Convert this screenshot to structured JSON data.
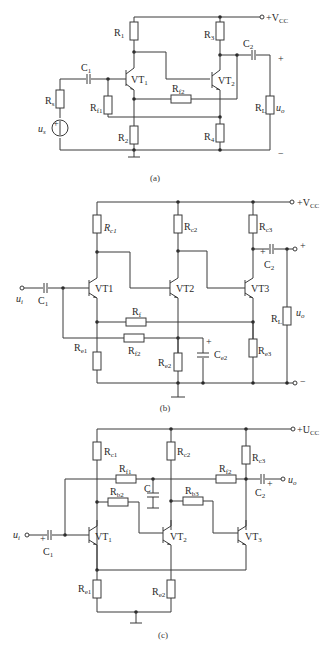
{
  "header_fragment": "",
  "figures": [
    {
      "caption": "(a)",
      "supply": "+V",
      "supply_sub": "CC",
      "labels": {
        "R1": [
          "R",
          "1"
        ],
        "R2": [
          "R",
          "2"
        ],
        "R3": [
          "R",
          "3"
        ],
        "R4": [
          "R",
          "4"
        ],
        "Rs": [
          "R",
          "s"
        ],
        "Rf1": [
          "R",
          "f1"
        ],
        "Rf2": [
          "R",
          "f2"
        ],
        "RL": [
          "R",
          "L"
        ],
        "C1": [
          "C",
          "1"
        ],
        "C2": [
          "C",
          "2"
        ],
        "VT1": [
          "VT",
          "1"
        ],
        "VT2": [
          "VT",
          "2"
        ],
        "us": [
          "u",
          "s"
        ],
        "uo": [
          "u",
          "o"
        ]
      },
      "plus": "+",
      "minus": "−"
    },
    {
      "caption": "(b)",
      "supply": "+V",
      "supply_sub": "CC",
      "labels": {
        "Rc1": [
          "R",
          "c1"
        ],
        "Rc2": [
          "R",
          "c2"
        ],
        "Rc3": [
          "R",
          "c3"
        ],
        "Re1": [
          "R",
          "e1"
        ],
        "Re2": [
          "R",
          "e2"
        ],
        "Re3": [
          "R",
          "e3"
        ],
        "Rf": [
          "R",
          "f"
        ],
        "Rf2": [
          "R",
          "f2"
        ],
        "RL": [
          "R",
          "L"
        ],
        "C1": [
          "C",
          "1"
        ],
        "C2": [
          "C",
          "2"
        ],
        "Ce2": [
          "C",
          "e2"
        ],
        "VT1": [
          "VT1",
          ""
        ],
        "VT2": [
          "VT2",
          ""
        ],
        "VT3": [
          "VT3",
          ""
        ],
        "ui": [
          "u",
          "i"
        ],
        "uo": [
          "u",
          "o"
        ]
      },
      "plus": "+",
      "minus": "−"
    },
    {
      "caption": "(c)",
      "supply": "+U",
      "supply_sub": "CC",
      "labels": {
        "Rc1": [
          "R",
          "c1"
        ],
        "Rc2": [
          "R",
          "c2"
        ],
        "Rc3": [
          "R",
          "c3"
        ],
        "Re1": [
          "R",
          "e1"
        ],
        "Re2": [
          "R",
          "e2"
        ],
        "Rf1": [
          "R",
          "f1"
        ],
        "Rf2": [
          "R",
          "f2"
        ],
        "Rb2": [
          "R",
          "b2"
        ],
        "Rb3": [
          "R",
          "b3"
        ],
        "C": [
          "C",
          ""
        ],
        "C1": [
          "C",
          "1"
        ],
        "C2": [
          "C",
          "2"
        ],
        "VT1": [
          "VT",
          "1"
        ],
        "VT2": [
          "VT",
          "2"
        ],
        "VT3": [
          "VT",
          "3"
        ],
        "ui": [
          "u",
          "i"
        ],
        "uo": [
          "u",
          "o"
        ]
      },
      "plus": "+"
    }
  ]
}
